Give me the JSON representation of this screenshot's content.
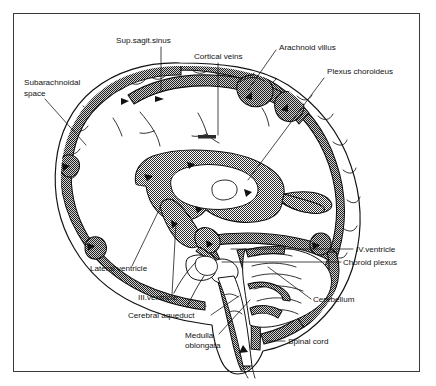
{
  "figure": {
    "type": "anatomical-diagram",
    "border_color": "#3a3a3a",
    "background_color": "#ffffff",
    "ink_color": "#111111",
    "shading_color": "#4a4a4a",
    "shading_description": "fine checkerboard stipple marking subarachnoid space, ventricles and venous sinuses"
  },
  "labels": [
    {
      "id": "sup-sagit-sinus",
      "text": "Sup.sagit.sinus",
      "lines": [
        "Sup.sagit.sinus"
      ],
      "x": 116,
      "y": 43,
      "anchor": "start"
    },
    {
      "id": "cortical-veins",
      "text": "Cortical veins",
      "lines": [
        "Cortical veins"
      ],
      "x": 194,
      "y": 59,
      "anchor": "start"
    },
    {
      "id": "arachnoid-villus",
      "text": "Arachnoid villus",
      "lines": [
        "Arachnoid villus"
      ],
      "x": 279,
      "y": 50,
      "anchor": "start"
    },
    {
      "id": "plexus-choroideus",
      "text": "Plexus choroideus",
      "lines": [
        "Plexus choroideus"
      ],
      "x": 327,
      "y": 74,
      "anchor": "start"
    },
    {
      "id": "subarachnoidal-space",
      "text": "Subarachnoidal space",
      "lines": [
        "Subarachnoidal",
        "space"
      ],
      "x": 24,
      "y": 84,
      "anchor": "start"
    },
    {
      "id": "iv-ventricle",
      "text": "IV.ventricle",
      "lines": [
        "IV.ventricle"
      ],
      "x": 356,
      "y": 252,
      "anchor": "start"
    },
    {
      "id": "choroid-plexus",
      "text": "Choroid plexus",
      "lines": [
        "Choroid plexus"
      ],
      "x": 343,
      "y": 265,
      "anchor": "start"
    },
    {
      "id": "cerebellum",
      "text": "Cerebellum",
      "lines": [
        "Cerebellum"
      ],
      "x": 313,
      "y": 302,
      "anchor": "start"
    },
    {
      "id": "spinal-cord",
      "text": "Spinal cord",
      "lines": [
        "Spinal cord"
      ],
      "x": 288,
      "y": 344,
      "anchor": "start"
    },
    {
      "id": "lateral-ventricle",
      "text": "Lateral ventricle",
      "lines": [
        "Lateral ventricle"
      ],
      "x": 90,
      "y": 271,
      "anchor": "start"
    },
    {
      "id": "iii-ventricle",
      "text": "III.ventricle",
      "lines": [
        "III.ventricle"
      ],
      "x": 138,
      "y": 300,
      "anchor": "start"
    },
    {
      "id": "cerebral-aqueduct",
      "text": "Cerebral aqueduct",
      "lines": [
        "Cerebral aqueduct"
      ],
      "x": 128,
      "y": 318,
      "anchor": "start"
    },
    {
      "id": "medulla-oblongata",
      "text": "Medulla oblongata",
      "lines": [
        "Medulla",
        "oblongata"
      ],
      "x": 185,
      "y": 338,
      "anchor": "start"
    }
  ],
  "structures": [
    {
      "id": "skull-outline",
      "name": "skull and scalp outline"
    },
    {
      "id": "subarachnoid-band",
      "name": "subarachnoid space / CSF band"
    },
    {
      "id": "superior-sagittal-sinus",
      "name": "superior sagittal sinus"
    },
    {
      "id": "arachnoid-villi",
      "name": "arachnoid villi"
    },
    {
      "id": "cortical-veins",
      "name": "cortical bridging veins"
    },
    {
      "id": "lateral-ventricle",
      "name": "lateral ventricle"
    },
    {
      "id": "third-ventricle",
      "name": "third ventricle"
    },
    {
      "id": "cerebral-aqueduct",
      "name": "cerebral aqueduct"
    },
    {
      "id": "fourth-ventricle",
      "name": "fourth ventricle"
    },
    {
      "id": "choroid-plexus",
      "name": "choroid plexus"
    },
    {
      "id": "cerebellum",
      "name": "cerebellum"
    },
    {
      "id": "brainstem",
      "name": "brainstem / medulla oblongata"
    },
    {
      "id": "spinal-cord",
      "name": "spinal cord"
    },
    {
      "id": "flow-arrows",
      "name": "CSF flow direction arrows"
    }
  ]
}
